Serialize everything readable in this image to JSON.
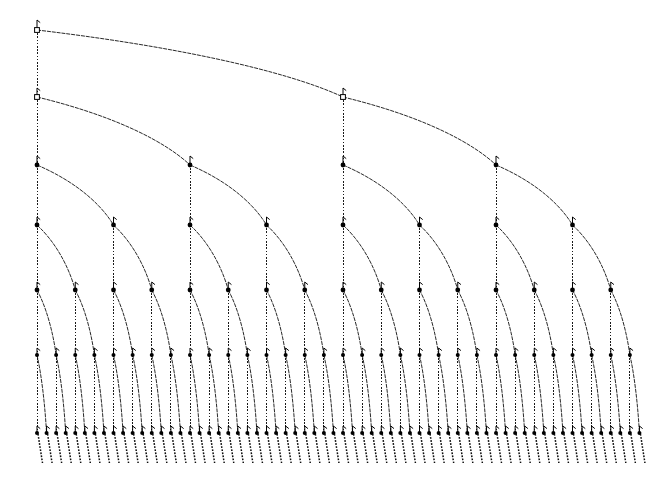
{
  "figure": {
    "background_color": "#ffffff",
    "line_color": "#000000",
    "width": 668,
    "height": 478
  },
  "chart_data": {
    "type": "diagram",
    "title": "",
    "xlabel": "",
    "ylabel": "",
    "grid": false,
    "legend": null,
    "structure": "complete-binary-tree",
    "depth_levels": 7,
    "leaf_count": 64,
    "node_count": 127,
    "root": {
      "x": 37,
      "y": 30
    },
    "level_y": [
      30,
      97,
      165,
      225,
      290,
      355,
      433
    ],
    "level_counts": [
      1,
      2,
      4,
      8,
      16,
      32,
      64
    ],
    "level_spacing_x": [
      0,
      306,
      153,
      76.5,
      38.25,
      19.125,
      9.5625
    ],
    "x_start": 37,
    "leaf_stub_length": 30,
    "edge_styles": {
      "left_child": "dotted-vertical",
      "right_child": "dashed-diagonal-curved"
    },
    "node_marker": {
      "filled_radius": 2.2,
      "hook_height": 9,
      "root_style": "open-square"
    }
  }
}
